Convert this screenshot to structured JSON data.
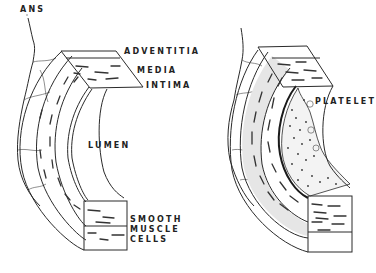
{
  "diagram": {
    "type": "anatomical-illustration",
    "colors": {
      "ink": "#2a2a2a",
      "background": "#ffffff",
      "shading": "#e6e6e6"
    }
  },
  "left_panel": {
    "labels": {
      "nerve": "ANS",
      "adventitia": "ADVENTITIA",
      "media": "MEDIA",
      "intima": "INTIMA",
      "lumen": "LUMEN",
      "smooth_muscle": [
        "SMOOTH",
        "MUSCLE",
        "CELLS"
      ]
    }
  },
  "right_panel": {
    "labels": {
      "platelet": "PLATELET"
    }
  }
}
